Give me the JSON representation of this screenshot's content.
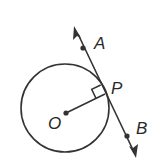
{
  "diagram": {
    "colors": {
      "stroke": "#333333",
      "background": "#ffffff"
    },
    "circle": {
      "center_label": "O",
      "cx": 65,
      "cy": 108,
      "r": 44
    },
    "center_point": {
      "label": "O",
      "x": 66,
      "y": 113
    },
    "tangent_point": {
      "label": "P",
      "x": 105,
      "y": 94
    },
    "line_points": [
      {
        "label": "A",
        "x": 83,
        "y": 48
      },
      {
        "label": "B",
        "x": 127,
        "y": 136
      }
    ],
    "right_angle_marker": "square at P between radius OP and line AB",
    "labels": {
      "A": "A",
      "B": "B",
      "P": "P",
      "O": "O"
    }
  }
}
